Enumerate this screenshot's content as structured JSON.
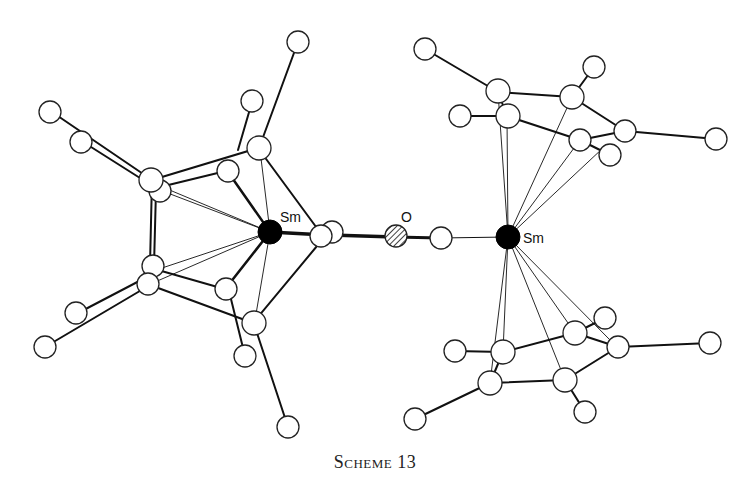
{
  "figure": {
    "caption": "Scheme 13",
    "labels": {
      "sm_left": "Sm",
      "sm_right": "Sm",
      "oxygen": "O"
    }
  },
  "colors": {
    "bond": "#111111",
    "atom_fill": "#ffffff",
    "samarium": "#000000"
  }
}
